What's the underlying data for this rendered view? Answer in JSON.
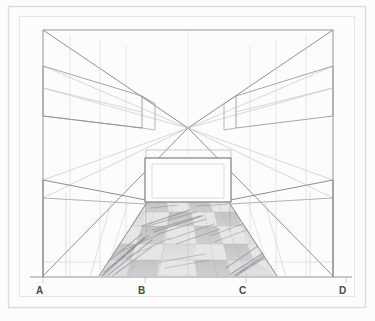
{
  "artwork": {
    "title": "One-point perspective interior drawing",
    "medium": "graphite pencil on paper",
    "background_color": "#fcfcfa",
    "line_color": "#8f8f93",
    "label_color": "#4a4a4a",
    "frame_color": "#d8d8d4",
    "shading_color": "#9a9a9e"
  },
  "frame": {
    "outer": {
      "x": 8,
      "y": 6,
      "width": 358,
      "height": 302
    },
    "inner": {
      "x": 19,
      "y": 16,
      "width": 336,
      "height": 281
    }
  },
  "vanishing_point": {
    "x": 188,
    "y": 128,
    "marker": "dot"
  },
  "room": {
    "left_wall_x": 43,
    "right_wall_x": 333,
    "ceiling_y": 30,
    "floor_y": 276,
    "back_wall": {
      "x": 145,
      "y": 158,
      "width": 86,
      "height": 44
    }
  },
  "labels": [
    {
      "id": "A",
      "text": "A",
      "x": 38,
      "y": 290
    },
    {
      "id": "B",
      "text": "B",
      "x": 140,
      "y": 290
    },
    {
      "id": "C",
      "text": "C",
      "x": 241,
      "y": 290
    },
    {
      "id": "D",
      "text": "D",
      "x": 341,
      "y": 290
    }
  ],
  "baseline": {
    "y": 277,
    "x1": 30,
    "x2": 352
  },
  "floor": {
    "near_left_x": 99,
    "near_right_x": 277,
    "far_left_x": 146,
    "far_right_x": 230,
    "near_y": 276,
    "far_y": 202,
    "tile_rows": 5,
    "tile_cols": 4,
    "pattern": "checkerboard"
  },
  "elements": {
    "upper_cabinet_left": {
      "label": "upper-cabinet-left"
    },
    "upper_cabinet_right": {
      "label": "upper-cabinet-right"
    },
    "counter_left": {
      "label": "counter-left"
    },
    "counter_right": {
      "label": "counter-right"
    },
    "back_wall_panel": {
      "label": "back-wall-panel"
    }
  }
}
